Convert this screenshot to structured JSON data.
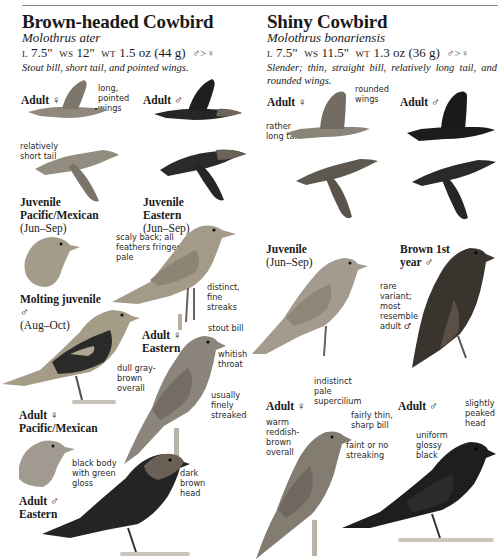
{
  "page": {
    "species": [
      {
        "id": "brown-headed",
        "name": "Brown-headed Cowbird",
        "scientific": "Molothrus ater",
        "length_label": "L",
        "length": "7.5\"",
        "wingspan_label": "WS",
        "wingspan": "12\"",
        "weight_label": "WT",
        "weight": "1.5 oz (44 g)",
        "size_dimorphism": "♂>♀",
        "description": "Stout bill, short tail, and pointed wings."
      },
      {
        "id": "shiny",
        "name": "Shiny Cowbird",
        "scientific": "Molothrus bonariensis",
        "length_label": "L",
        "length": "7.5\"",
        "wingspan_label": "WS",
        "wingspan": "11.5\"",
        "weight_label": "WT",
        "weight": "1.3 oz (36 g)",
        "size_dimorphism": "♂>♀",
        "description": "Slender; thin, straight bill, relatively long tail, and rounded wings."
      }
    ]
  },
  "brown_headed": {
    "flight_female_label": "Adult ♀",
    "flight_male_label": "Adult ♂",
    "note_long_wings": "long, pointed wings",
    "note_short_tail": "relatively short tail",
    "juv_pacific": {
      "title": "Juvenile Pacific/Mexican",
      "dates": "(Jun–Sep)"
    },
    "juv_eastern": {
      "title": "Juvenile Eastern",
      "dates": "(Jun–Sep)"
    },
    "note_scaly_back": "scaly back; all feathers fringed pale",
    "note_distinct_streaks": "distinct, fine streaks",
    "molting_juv": {
      "title": "Molting juvenile ♂",
      "dates": "(Aug–Oct)"
    },
    "adult_f_eastern": "Adult ♀ Eastern",
    "note_stout_bill": "stout bill",
    "note_whitish_throat": "whitish throat",
    "note_dull_gray": "dull gray-brown overall",
    "note_finely_streaked": "usually finely streaked",
    "adult_f_pacific": "Adult ♀ Pacific/Mexican",
    "adult_m_eastern": "Adult ♂ Eastern",
    "note_black_body": "black body with green gloss",
    "note_dark_brown_head": "dark brown head"
  },
  "shiny": {
    "flight_female_label": "Adult ♀",
    "flight_male_label": "Adult ♂",
    "note_rounded_wings": "rounded wings",
    "note_long_tail": "rather long tail",
    "juvenile": {
      "title": "Juvenile",
      "dates": "(Jun–Sep)"
    },
    "brown_1st_year": "Brown 1st year ♂",
    "note_rare_variant": "rare variant; most resemble adult ♂",
    "adult_f": "Adult ♀",
    "note_supercilium": "indistinct pale supercilium",
    "note_thin_bill": "fairly thin, sharp bill",
    "note_warm_reddish": "warm reddish-brown overall",
    "note_faint_streaking": "faint or no streaking",
    "adult_m": "Adult ♂",
    "note_peaked_head": "slightly peaked head",
    "note_glossy_black": "uniform glossy black"
  },
  "colors": {
    "female_gray_brown": "#8a8378",
    "juvenile_buff": "#a8a08e",
    "male_black": "#232323",
    "male_brown_head": "#6e645a",
    "shiny_female": "#837b70",
    "rule": "#8a8a8a"
  }
}
